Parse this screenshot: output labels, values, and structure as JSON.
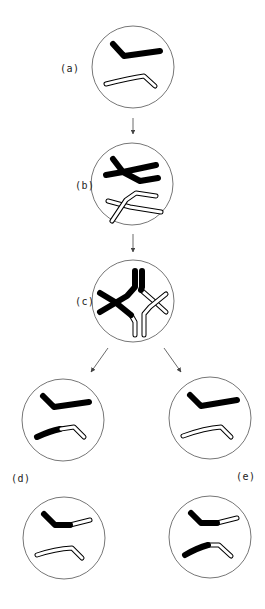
{
  "diagram": {
    "type": "chromosome crossing-over stages",
    "stages": [
      {
        "id": "a",
        "label": "(a)",
        "description": "homologous chromosomes (black and white) before pairing"
      },
      {
        "id": "b",
        "label": "(b)",
        "description": "synapsis of homologous chromatids"
      },
      {
        "id": "c",
        "label": "(c)",
        "description": "chiasma / crossing over between chromatids"
      },
      {
        "id": "d",
        "label": "(d)",
        "description": "resulting recombinant chromosomes - outcome d"
      },
      {
        "id": "e",
        "label": "(e)",
        "description": "resulting recombinant chromosomes - outcome e"
      }
    ],
    "colors": {
      "maternal": "#000000",
      "paternal": "#ffffff",
      "outline": "#333333",
      "circle": "#555555"
    }
  }
}
